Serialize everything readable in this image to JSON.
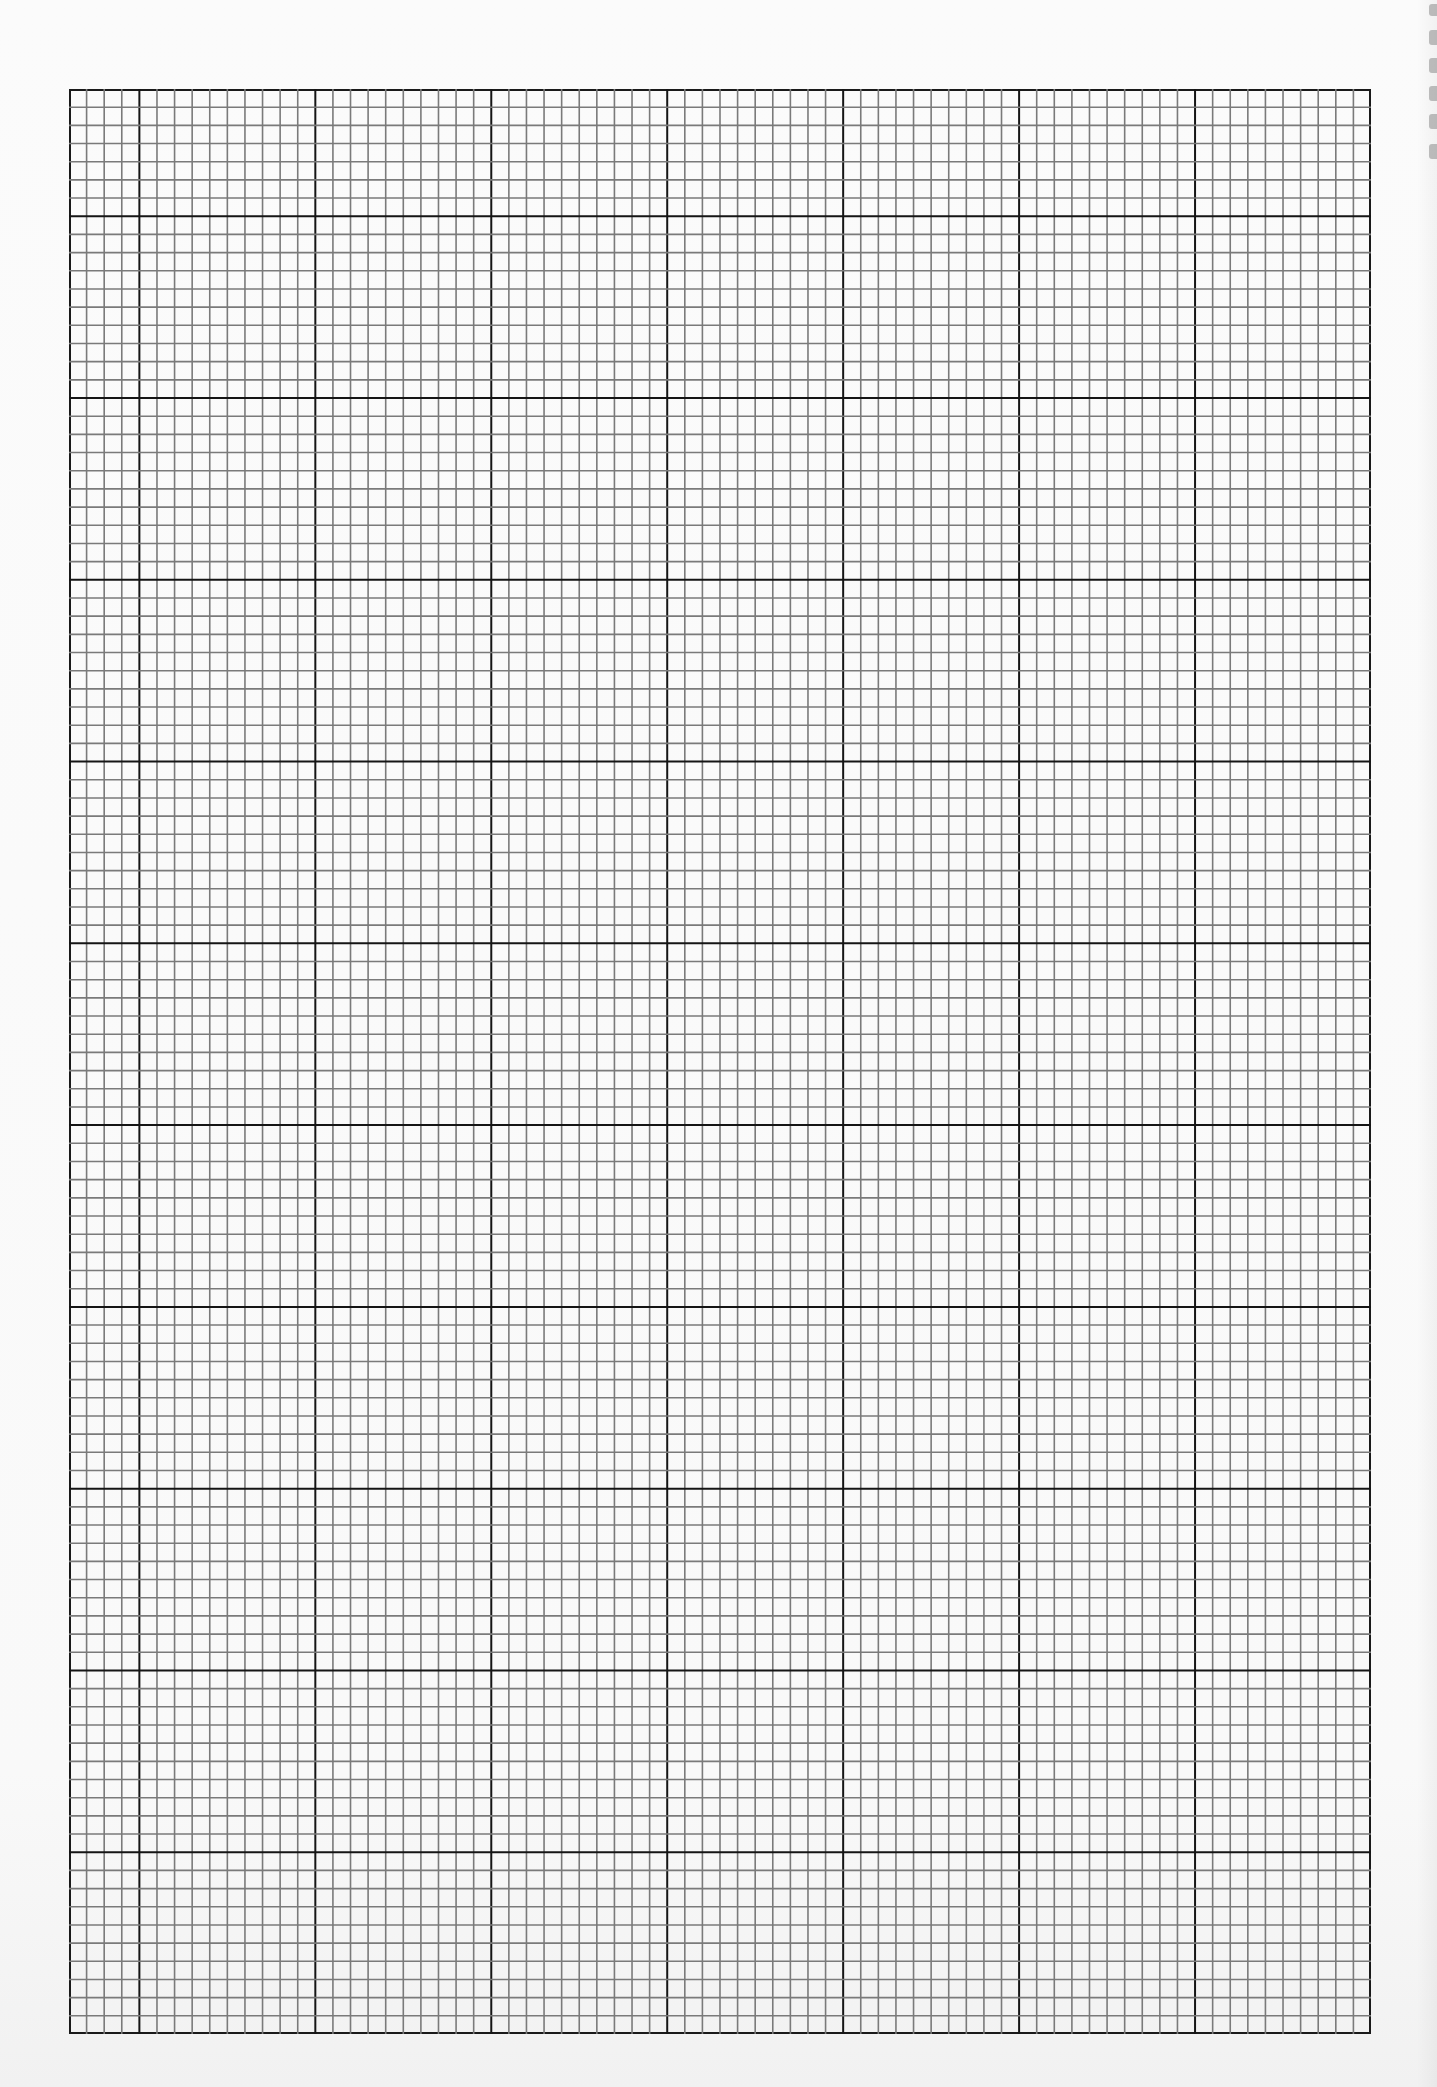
{
  "page": {
    "type": "graph-paper-sheet",
    "background_color": "#fbfbfb"
  },
  "grid": {
    "left": 69,
    "top": 89,
    "width": 1302,
    "height": 1945,
    "minor_cell_w": 17.57,
    "minor_cell_h": 18.17,
    "cells_per_major": 10,
    "leading_partial_cols": 4,
    "leading_partial_rows": 7,
    "major_cols": 7,
    "major_rows": 10,
    "total_minor_cols": 74,
    "total_minor_rows": 107,
    "minor_line_color": "#7a7a7a",
    "major_line_color": "#151515",
    "border_color": "#1a1a1a"
  },
  "perforations": [
    {
      "top": 4,
      "height": 12
    },
    {
      "top": 30,
      "height": 15
    },
    {
      "top": 58,
      "height": 15
    },
    {
      "top": 86,
      "height": 15
    },
    {
      "top": 114,
      "height": 15
    },
    {
      "top": 144,
      "height": 15
    }
  ]
}
